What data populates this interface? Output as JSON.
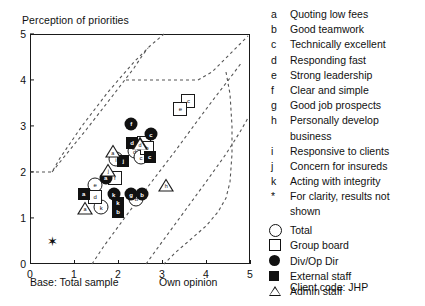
{
  "chart": {
    "title": "Perception of priorities",
    "base_note": "Base: Total sample",
    "xaxis_note": "Own opinion",
    "yticks": [
      "5",
      "4",
      "3",
      "2",
      "1",
      "0"
    ],
    "xticks": [
      "0",
      "1",
      "2",
      "3",
      "4",
      "5"
    ]
  },
  "legend": {
    "attributes": [
      {
        "key": "a",
        "text": "Quoting low fees"
      },
      {
        "key": "b",
        "text": "Good teamwork"
      },
      {
        "key": "c",
        "text": "Technically excellent"
      },
      {
        "key": "d",
        "text": "Responding fast"
      },
      {
        "key": "e",
        "text": "Strong leadership"
      },
      {
        "key": "f",
        "text": "Clear and simple"
      },
      {
        "key": "g",
        "text": "Good job prospects"
      },
      {
        "key": "h",
        "text": "Personally develop",
        "text2": "business"
      },
      {
        "key": "i",
        "text": "Responsive to clients"
      },
      {
        "key": "j",
        "text": "Concern for insureds"
      },
      {
        "key": "k",
        "text": "Acting with integrity"
      },
      {
        "key": "*",
        "text": "For clarity, results not",
        "text2": "shown"
      }
    ],
    "series": [
      {
        "symbol": "circle",
        "label": "Total"
      },
      {
        "symbol": "square",
        "label": "Group board"
      },
      {
        "symbol": "dot",
        "label": "Div/Op Dir"
      },
      {
        "symbol": "filled-square",
        "label": "External staff"
      },
      {
        "symbol": "triangle",
        "label": "Admin staff"
      }
    ],
    "client_code": "Client code: JHP"
  },
  "chart_data": {
    "type": "scatter",
    "title": "Perception of priorities",
    "xlabel": "Own opinion",
    "ylabel": "Perception of priorities",
    "xlim": [
      0,
      5
    ],
    "ylim": [
      0,
      5
    ],
    "grid": false,
    "legend_position": "right",
    "series": [
      {
        "name": "Total",
        "symbol": "circle",
        "points": [
          {
            "label": "i",
            "x": 1.95,
            "y": 2.28
          },
          {
            "label": "d",
            "x": 2.38,
            "y": 2.45
          },
          {
            "label": "c",
            "x": 2.52,
            "y": 2.32
          },
          {
            "label": "e",
            "x": 1.48,
            "y": 1.72
          },
          {
            "label": "k",
            "x": 1.62,
            "y": 1.23
          },
          {
            "label": "b",
            "x": 2.42,
            "y": 1.42
          }
        ]
      },
      {
        "name": "Group board",
        "symbol": "square",
        "points": [
          {
            "label": "c",
            "x": 3.6,
            "y": 3.55
          },
          {
            "label": "e",
            "x": 3.42,
            "y": 3.38
          },
          {
            "label": "d",
            "x": 2.58,
            "y": 2.62
          },
          {
            "label": "b",
            "x": 2.66,
            "y": 2.52
          },
          {
            "label": "f",
            "x": 1.93,
            "y": 1.88
          },
          {
            "label": "d",
            "x": 1.48,
            "y": 1.45
          }
        ]
      },
      {
        "name": "Div/Op Dir",
        "symbol": "dot",
        "points": [
          {
            "label": "f",
            "x": 2.3,
            "y": 3.05
          },
          {
            "label": "c",
            "x": 2.75,
            "y": 2.82
          },
          {
            "label": "a",
            "x": 1.72,
            "y": 1.88
          },
          {
            "label": "k",
            "x": 1.9,
            "y": 1.52
          },
          {
            "label": "g",
            "x": 2.3,
            "y": 1.52
          },
          {
            "label": "b",
            "x": 2.55,
            "y": 1.52
          }
        ]
      },
      {
        "name": "External staff",
        "symbol": "filled-square",
        "points": [
          {
            "label": "d",
            "x": 2.32,
            "y": 2.62
          },
          {
            "label": "c",
            "x": 2.72,
            "y": 2.32
          },
          {
            "label": "j",
            "x": 2.12,
            "y": 2.25
          },
          {
            "label": "a",
            "x": 1.22,
            "y": 1.52
          },
          {
            "label": "k",
            "x": 2.0,
            "y": 1.32
          },
          {
            "label": "b",
            "x": 2.0,
            "y": 1.13
          }
        ]
      },
      {
        "name": "Admin staff",
        "symbol": "triangle",
        "points": [
          {
            "label": "a",
            "x": 1.88,
            "y": 2.45
          },
          {
            "label": "d",
            "x": 2.5,
            "y": 2.62
          },
          {
            "label": "j",
            "x": 1.78,
            "y": 2.05
          },
          {
            "label": "h",
            "x": 3.1,
            "y": 1.72
          },
          {
            "label": "a",
            "x": 1.25,
            "y": 1.22
          }
        ]
      },
      {
        "name": "Not shown",
        "symbol": "star",
        "points": [
          {
            "label": "*",
            "x": 0.5,
            "y": 0.5
          }
        ]
      }
    ]
  }
}
